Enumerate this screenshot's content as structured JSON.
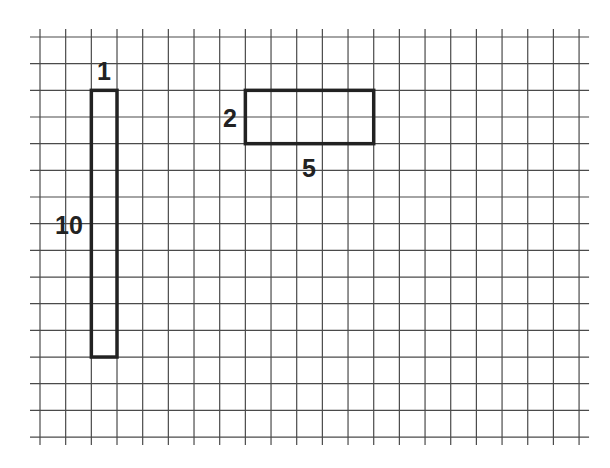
{
  "diagram": {
    "type": "grid-rectangles",
    "grid": {
      "columns": 21,
      "rows": 15,
      "origin_x": 40,
      "origin_y": 37,
      "cell_w": 25.67,
      "cell_h": 26.67,
      "line_color": "#4a4a4a",
      "overhang": 8
    },
    "shapes": [
      {
        "id": "tall-rectangle",
        "col": 2,
        "row": 2,
        "width_cells": 1,
        "height_cells": 10,
        "stroke": "#222222",
        "labels": [
          {
            "text": "1",
            "side": "top",
            "x": 104,
            "y": 80
          },
          {
            "text": "10",
            "side": "left",
            "x": 69,
            "y": 234
          }
        ]
      },
      {
        "id": "wide-rectangle",
        "col": 8,
        "row": 2,
        "width_cells": 5,
        "height_cells": 2,
        "stroke": "#222222",
        "labels": [
          {
            "text": "2",
            "side": "left",
            "x": 230,
            "y": 127
          },
          {
            "text": "5",
            "side": "bottom",
            "x": 309,
            "y": 177
          }
        ]
      }
    ]
  }
}
